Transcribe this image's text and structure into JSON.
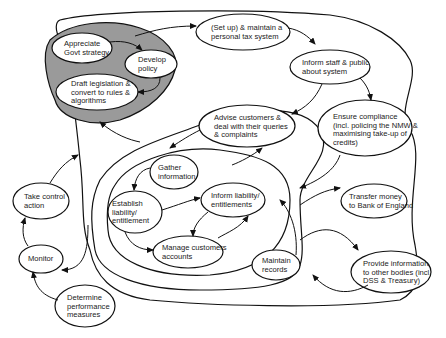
{
  "diagram": {
    "type": "process map / rich picture",
    "shaded_region_color": "#9a9a9a",
    "nodes": [
      {
        "id": "appreciate",
        "label": "Appreciate\nGovt strategy"
      },
      {
        "id": "develop",
        "label": "Develop\npolicy"
      },
      {
        "id": "draft",
        "label": "Draft legislation &\nconvert to rules &\nalgorithms"
      },
      {
        "id": "setup",
        "label": "(Set up) & maintain a\npersonal tax system"
      },
      {
        "id": "inform_staff",
        "label": "Inform staff & public\nabout system"
      },
      {
        "id": "advise",
        "label": "Advise customers &\ndeal with their queries\n& complaints"
      },
      {
        "id": "ensure",
        "label": "Ensure compliance\n(incl. policing the NMW &\nmaximising take-up of\ncredits)"
      },
      {
        "id": "gather",
        "label": "Gather\ninformation"
      },
      {
        "id": "establish",
        "label": "Establish\nliability/\nentitlement"
      },
      {
        "id": "inform_liab",
        "label": "Inform liability/\nentitlements"
      },
      {
        "id": "manage",
        "label": "Manage customers\naccounts"
      },
      {
        "id": "maintain",
        "label": "Maintain\nrecords"
      },
      {
        "id": "transfer",
        "label": "Transfer money\nto Bank of England"
      },
      {
        "id": "provide",
        "label": "Provide information\nto other bodies (incl.\nDSS & Treasury)"
      },
      {
        "id": "take_control",
        "label": "Take control\naction"
      },
      {
        "id": "monitor",
        "label": "Monitor"
      },
      {
        "id": "determine",
        "label": "Determine\nperformance\nmeasures"
      }
    ],
    "edges": [
      {
        "from": "appreciate",
        "to": "develop"
      },
      {
        "from": "develop",
        "to": "draft"
      },
      {
        "from": "policy_region",
        "to": "setup"
      },
      {
        "from": "setup",
        "to": "inform_staff"
      },
      {
        "from": "inform_staff",
        "to": "advise"
      },
      {
        "from": "inform_staff",
        "to": "ensure"
      },
      {
        "from": "advise",
        "to": "gather"
      },
      {
        "from": "inner_region",
        "to": "advise"
      },
      {
        "from": "gather",
        "to": "establish"
      },
      {
        "from": "establish",
        "to": "inform_liab"
      },
      {
        "from": "establish",
        "to": "manage"
      },
      {
        "from": "inform_liab",
        "to": "manage"
      },
      {
        "from": "manage",
        "to": "inform_liab"
      },
      {
        "from": "maintain",
        "to": "inner_region"
      },
      {
        "from": "ensure",
        "to": "operations_region"
      },
      {
        "from": "operations_region",
        "to": "transfer"
      },
      {
        "from": "operations_region",
        "to": "provide"
      },
      {
        "from": "provide",
        "to": "operations_region"
      },
      {
        "from": "operations_region",
        "to": "policy_region"
      },
      {
        "from": "determine",
        "to": "monitor"
      },
      {
        "from": "monitor",
        "to": "take_control"
      },
      {
        "from": "take_control",
        "to": "system_region"
      },
      {
        "from": "system_region",
        "to": "monitor"
      }
    ]
  }
}
